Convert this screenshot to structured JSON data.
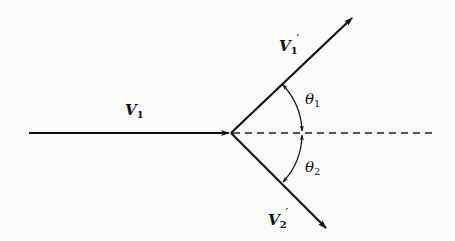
{
  "diagram": {
    "type": "vector-collision-diagram",
    "incoming_vector": {
      "symbol": "V",
      "subscript": "1",
      "prime": ""
    },
    "outgoing_vector_1": {
      "symbol": "V",
      "subscript": "1",
      "prime": "′"
    },
    "outgoing_vector_2": {
      "symbol": "V",
      "subscript": "2",
      "prime": "′"
    },
    "angle_1": {
      "symbol": "θ",
      "subscript": "1"
    },
    "angle_2": {
      "symbol": "θ",
      "subscript": "2"
    },
    "reference_line": "dashed",
    "colors": {
      "ink": "#111111",
      "background": "#fbfbfa"
    }
  }
}
